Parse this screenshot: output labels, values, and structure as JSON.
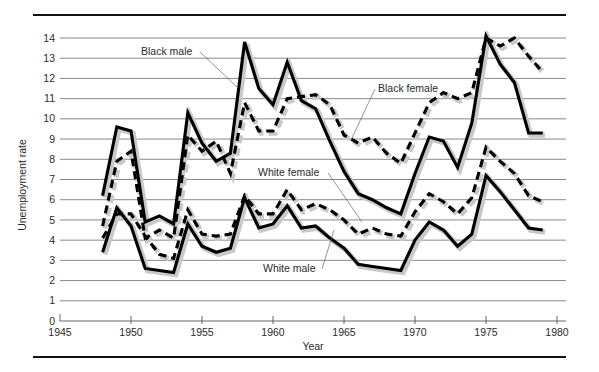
{
  "chart_data": {
    "type": "line",
    "title": "",
    "xlabel": "Year",
    "ylabel": "Unemployment rate",
    "xlim": [
      1945,
      1980
    ],
    "ylim": [
      0,
      14.6
    ],
    "grid": true,
    "legend_position": "inline-annotations",
    "x_ticks": [
      "1945",
      "1950",
      "1955",
      "1960",
      "1965",
      "1970",
      "1975",
      "1980"
    ],
    "y_ticks": [
      "0",
      "1",
      "2",
      "3",
      "4",
      "5",
      "6",
      "7",
      "8",
      "9",
      "10",
      "11",
      "12",
      "13",
      "14"
    ],
    "x": [
      1948,
      1949,
      1950,
      1951,
      1952,
      1953,
      1954,
      1955,
      1956,
      1957,
      1958,
      1959,
      1960,
      1961,
      1962,
      1963,
      1964,
      1965,
      1966,
      1967,
      1968,
      1969,
      1970,
      1971,
      1972,
      1973,
      1974,
      1975,
      1976,
      1977,
      1978,
      1979
    ],
    "series": [
      {
        "name": "Black male",
        "style": "solid",
        "values": [
          6.2,
          9.6,
          9.4,
          4.9,
          5.2,
          4.8,
          10.3,
          8.8,
          7.9,
          8.3,
          13.8,
          11.5,
          10.7,
          12.8,
          10.9,
          10.5,
          8.9,
          7.4,
          6.3,
          6.0,
          5.6,
          5.3,
          7.3,
          9.1,
          8.9,
          7.6,
          9.8,
          14.1,
          12.7,
          11.8,
          9.3,
          9.3
        ]
      },
      {
        "name": "Black female",
        "style": "dashed",
        "values": [
          4.7,
          7.9,
          8.4,
          4.1,
          4.5,
          4.1,
          9.2,
          8.4,
          8.9,
          7.3,
          10.8,
          9.4,
          9.4,
          11.0,
          11.1,
          11.2,
          10.7,
          9.2,
          8.8,
          9.1,
          8.3,
          7.8,
          9.3,
          10.8,
          11.3,
          11.0,
          11.3,
          14.0,
          13.6,
          14.0,
          13.1,
          12.3
        ]
      },
      {
        "name": "White male",
        "style": "solid",
        "values": [
          3.4,
          5.6,
          4.7,
          2.6,
          2.5,
          2.4,
          4.8,
          3.7,
          3.4,
          3.6,
          6.1,
          4.6,
          4.8,
          5.7,
          4.6,
          4.7,
          4.1,
          3.6,
          2.8,
          2.7,
          2.6,
          2.5,
          4.0,
          4.9,
          4.5,
          3.7,
          4.3,
          7.2,
          6.4,
          5.5,
          4.6,
          4.5
        ]
      },
      {
        "name": "White female",
        "style": "dashed",
        "values": [
          4.1,
          5.3,
          5.3,
          4.2,
          3.3,
          3.1,
          5.5,
          4.3,
          4.2,
          4.3,
          6.2,
          5.3,
          5.3,
          6.5,
          5.5,
          5.8,
          5.5,
          5.0,
          4.3,
          4.6,
          4.3,
          4.2,
          5.4,
          6.3,
          5.9,
          5.3,
          6.1,
          8.6,
          7.9,
          7.3,
          6.2,
          5.9
        ]
      }
    ],
    "annotations": [
      {
        "label": "Black male",
        "text_x": 141,
        "text_y": 55,
        "line_to_x": 238,
        "line_to_y": 88
      },
      {
        "label": "Black female",
        "text_x": 378,
        "text_y": 92,
        "line_to_x": 351,
        "line_to_y": 140
      },
      {
        "label": "White female",
        "text_x": 258,
        "text_y": 176,
        "line_to_x": 362,
        "line_to_y": 222
      },
      {
        "label": "White male",
        "text_x": 263,
        "text_y": 272,
        "line_to_x": 334,
        "line_to_y": 230
      }
    ]
  }
}
